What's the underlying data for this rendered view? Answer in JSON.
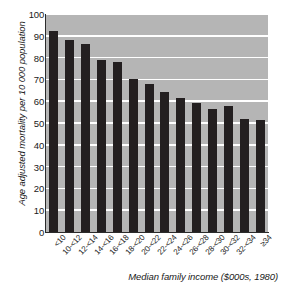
{
  "chart_data": {
    "type": "bar",
    "title": "",
    "xlabel": "Median family income ($000s, 1980)",
    "ylabel": "Age adjusted mortality per 10 000 population",
    "categories": [
      "<10",
      "10-<12",
      "12-<14",
      "14-<16",
      "16-<18",
      "18-<20",
      "20-<22",
      "22-<24",
      "24-<26",
      "26-<28",
      "28-<30",
      "30-<32",
      "32-<34",
      "≥34"
    ],
    "values": [
      92.0,
      88.0,
      86.4,
      79.0,
      78.0,
      70.0,
      68.0,
      64.3,
      61.5,
      59.0,
      56.6,
      57.8,
      51.7,
      51.3
    ],
    "ylim": [
      0,
      100
    ],
    "yticks": [
      0,
      10,
      20,
      30,
      40,
      50,
      60,
      70,
      80,
      90,
      100
    ],
    "ytick_labels": [
      "0",
      "10",
      "20",
      "30",
      "40",
      "50",
      "60",
      "70",
      "80",
      "90",
      "100"
    ],
    "grid": true,
    "grid_axis": "y",
    "legend": "none",
    "bar_color": "#231f20",
    "plot_background": "#b5b5b5",
    "gridline_color": "#ffffff"
  }
}
